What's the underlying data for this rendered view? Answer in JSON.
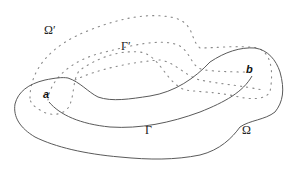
{
  "diagram": {
    "labels": {
      "omega": "Ω",
      "omega_prime": "Ω′",
      "gamma": "Γ",
      "gamma_prime": "Γ′",
      "point_a": "a",
      "point_b": "b"
    },
    "styles": {
      "solid_stroke": "#5a5a5a",
      "dotted_stroke": "#8a8a8a",
      "text_color": "#222222"
    }
  }
}
